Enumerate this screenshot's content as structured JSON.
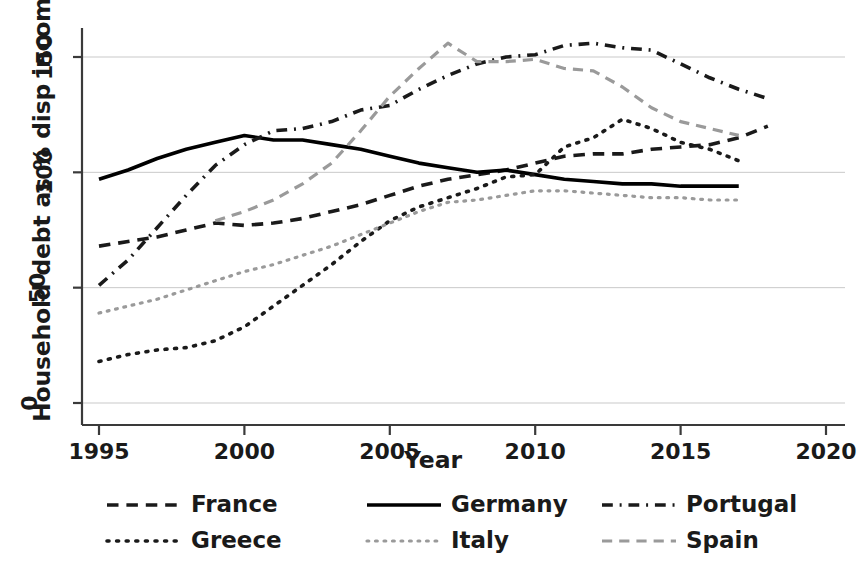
{
  "chart_data": {
    "type": "line",
    "title": "",
    "xlabel": "Year",
    "ylabel": "Household debt as % disp income",
    "xlim": [
      1993.5,
      2021.0
    ],
    "ylim": [
      -12,
      170
    ],
    "xticks": [
      1995,
      2000,
      2005,
      2010,
      2015,
      2020
    ],
    "yticks": [
      0,
      50,
      100,
      150
    ],
    "grid": "horizontal",
    "legend_position": "bottom",
    "legend_columns": 3,
    "series": [
      {
        "name": "France",
        "style": "dashed",
        "color": "#1a1a1a",
        "x": [
          1995,
          1996,
          1997,
          1998,
          1999,
          2000,
          2001,
          2002,
          2003,
          2004,
          2005,
          2006,
          2007,
          2008,
          2009,
          2010,
          2011,
          2012,
          2013,
          2014,
          2015,
          2016,
          2017,
          2018
        ],
        "values": [
          68,
          70,
          72,
          75,
          78,
          77,
          78,
          80,
          83,
          86,
          90,
          94,
          97,
          99,
          101,
          104,
          107,
          108,
          108,
          110,
          111,
          112,
          115,
          120
        ]
      },
      {
        "name": "Germany",
        "style": "solid",
        "color": "#000000",
        "x": [
          1995,
          1996,
          1997,
          1998,
          1999,
          2000,
          2001,
          2002,
          2003,
          2004,
          2005,
          2006,
          2007,
          2008,
          2009,
          2010,
          2011,
          2012,
          2013,
          2014,
          2015,
          2016,
          2017
        ],
        "values": [
          97,
          101,
          106,
          110,
          113,
          116,
          114,
          114,
          112,
          110,
          107,
          104,
          102,
          100,
          101,
          99,
          97,
          96,
          95,
          95,
          94,
          94,
          94
        ]
      },
      {
        "name": "Portugal",
        "style": "dashdot",
        "color": "#1a1a1a",
        "x": [
          1995,
          1996,
          1997,
          1998,
          1999,
          2000,
          2001,
          2002,
          2003,
          2004,
          2005,
          2006,
          2007,
          2008,
          2009,
          2010,
          2011,
          2012,
          2013,
          2014,
          2015,
          2016,
          2017,
          2018
        ],
        "values": [
          51,
          62,
          76,
          90,
          103,
          112,
          118,
          119,
          122,
          127,
          129,
          136,
          142,
          147,
          150,
          151,
          155,
          156,
          154,
          153,
          147,
          141,
          136,
          132
        ]
      },
      {
        "name": "Greece",
        "style": "dotted",
        "color": "#1a1a1a",
        "x": [
          1995,
          1996,
          1997,
          1998,
          1999,
          2000,
          2001,
          2002,
          2003,
          2004,
          2005,
          2006,
          2007,
          2008,
          2009,
          2010,
          2011,
          2012,
          2013,
          2014,
          2015,
          2016,
          2017
        ],
        "values": [
          18,
          21,
          23,
          24,
          27,
          33,
          42,
          51,
          60,
          70,
          79,
          85,
          89,
          93,
          98,
          99,
          111,
          115,
          123,
          119,
          113,
          110,
          105
        ]
      },
      {
        "name": "Italy",
        "style": "dotted",
        "color": "#9a9a9a",
        "x": [
          1995,
          1996,
          1997,
          1998,
          1999,
          2000,
          2001,
          2002,
          2003,
          2004,
          2005,
          2006,
          2007,
          2008,
          2009,
          2010,
          2011,
          2012,
          2013,
          2014,
          2015,
          2016,
          2017
        ],
        "values": [
          39,
          42,
          45,
          49,
          53,
          57,
          60,
          64,
          68,
          73,
          78,
          83,
          87,
          88,
          90,
          92,
          92,
          91,
          90,
          89,
          89,
          88,
          88
        ]
      },
      {
        "name": "Spain",
        "style": "dashed",
        "color": "#9a9a9a",
        "x": [
          1999,
          2000,
          2001,
          2002,
          2003,
          2004,
          2005,
          2006,
          2007,
          2008,
          2009,
          2010,
          2011,
          2012,
          2013,
          2014,
          2015,
          2016,
          2017
        ],
        "values": [
          79,
          83,
          88,
          95,
          104,
          118,
          133,
          145,
          156,
          148,
          148,
          149,
          145,
          144,
          137,
          128,
          122,
          119,
          116
        ]
      }
    ]
  },
  "axes": {
    "xtick_labels": [
      "1995",
      "2000",
      "2005",
      "2010",
      "2015",
      "2020"
    ],
    "ytick_labels": [
      "0",
      "50",
      "100",
      "150"
    ],
    "x_axis_title": "Year",
    "y_axis_title": "Household debt as % disp income"
  },
  "legend": {
    "items": [
      {
        "label": "France",
        "style": "dashed",
        "color": "#1a1a1a"
      },
      {
        "label": "Germany",
        "style": "solid",
        "color": "#000000"
      },
      {
        "label": "Portugal",
        "style": "dashdot",
        "color": "#1a1a1a"
      },
      {
        "label": "Greece",
        "style": "dotted",
        "color": "#1a1a1a"
      },
      {
        "label": "Italy",
        "style": "dotted",
        "color": "#9a9a9a"
      },
      {
        "label": "Spain",
        "style": "dashed",
        "color": "#9a9a9a"
      }
    ]
  }
}
